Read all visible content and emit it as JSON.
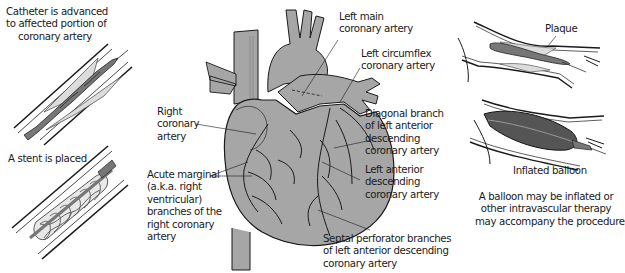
{
  "figure": {
    "panels": {
      "left_top": {
        "caption_lines": [
          "Catheter is advanced",
          "to affected portion of",
          "coronary artery"
        ]
      },
      "left_bottom": {
        "caption": "A stent is placed"
      },
      "heart": {
        "labels": {
          "left_main": [
            "Left main",
            "coronary artery"
          ],
          "left_circumflex": [
            "Left circumflex",
            "coronary artery"
          ],
          "diagonal_branch": [
            "Diagonal branch",
            "of left anterior",
            "descending",
            "coronary artery"
          ],
          "lad": [
            "Left anterior",
            "descending",
            "coronary artery"
          ],
          "septal": [
            "Septal perforator branches",
            "of left anterior descending",
            "coronary artery"
          ],
          "right_coronary": [
            "Right",
            "coronary",
            "artery"
          ],
          "acute_marginal": [
            "Acute marginal",
            "(a.k.a. right",
            "ventricular)",
            "branches of the",
            "right coronary",
            "artery"
          ]
        }
      },
      "right_top": {
        "label": "Plaque"
      },
      "right_bottom": {
        "label": "Inflated balloon",
        "caption_lines": [
          "A balloon may be inflated or",
          "other intravascular therapy",
          "may accompany the procedure"
        ]
      }
    },
    "colors": {
      "heart_fill": "#a6a6a6",
      "outline": "#1a1a1a",
      "plaque": "#dcdcdc",
      "balloon": "#555555",
      "catheter": "#777777"
    }
  }
}
